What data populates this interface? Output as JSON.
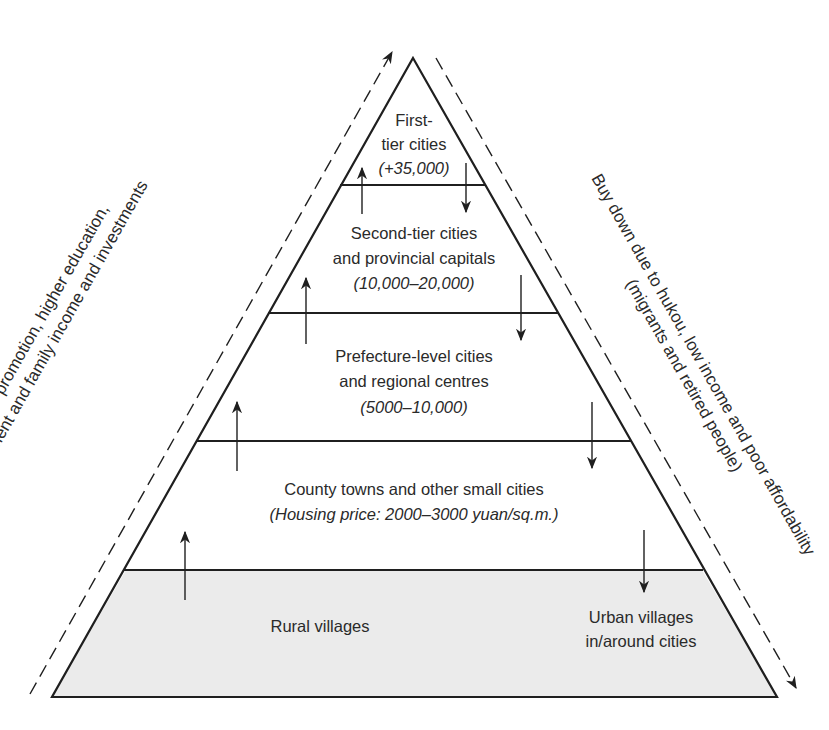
{
  "diagram": {
    "type": "pyramid",
    "colors": {
      "line": "#1f1f1f",
      "text": "#2a2a2a",
      "rural_fill": "#ebebeb",
      "background": "#ffffff"
    },
    "tiers": [
      {
        "id": "first-tier",
        "lines": [
          "First-",
          "tier cities"
        ],
        "price": "(+35,000)"
      },
      {
        "id": "second-tier",
        "lines": [
          "Second-tier cities",
          "and provincial capitals"
        ],
        "price": "(10,000–20,000)"
      },
      {
        "id": "prefecture",
        "lines": [
          "Prefecture-level cities",
          "and regional centres"
        ],
        "price": "(5000–10,000)"
      },
      {
        "id": "county",
        "lines": [
          "County towns and other small cities"
        ],
        "price": "(Housing price: 2000–3000 yuan/sq.m.)"
      },
      {
        "id": "rural",
        "lines": [
          "Rural villages"
        ]
      }
    ],
    "urban_villages": [
      "Urban villages",
      "in/around cities"
    ],
    "left_side": {
      "line1": "Buy up due to office promotion, higher education,",
      "line2": "changes in employment and family income and investments",
      "direction": "up"
    },
    "right_side": {
      "line1": "Buy down due to hukou, low income and poor affordability",
      "line2": "(migrants and retired people)",
      "direction": "down"
    }
  }
}
